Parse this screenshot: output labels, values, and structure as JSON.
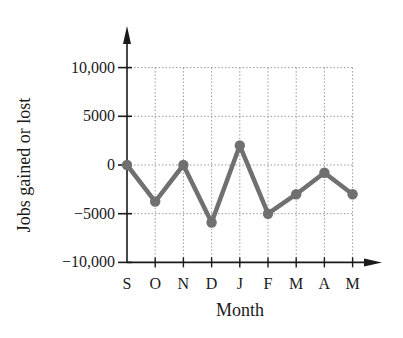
{
  "chart_data": {
    "type": "line",
    "title": "",
    "xlabel": "Month",
    "ylabel": "Jobs gained or lost",
    "categories": [
      "S",
      "O",
      "N",
      "D",
      "J",
      "F",
      "M",
      "A",
      "M"
    ],
    "values": [
      0,
      -3750,
      0,
      -5900,
      2000,
      -5000,
      -3000,
      -800,
      -3000
    ],
    "yticks": [
      10000,
      5000,
      0,
      -5000,
      -10000
    ],
    "ytick_labels": [
      "10,000",
      "5000",
      "0",
      "−5000",
      "−10,000"
    ],
    "ylim": [
      -10000,
      10000
    ],
    "grid": true,
    "grid_style": "dotted",
    "legend": null,
    "line_color": "#707070",
    "marker": "circle"
  },
  "labels": {
    "x_axis_title": "Month",
    "y_axis_title": "Jobs gained or lost"
  }
}
